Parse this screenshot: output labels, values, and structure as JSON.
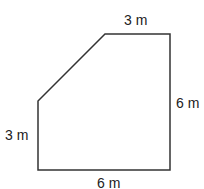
{
  "diagram": {
    "type": "polygon",
    "stroke_color": "#333333",
    "fill_color": "#ffffff",
    "vertices": [
      [
        105,
        34
      ],
      [
        170,
        34
      ],
      [
        170,
        170
      ],
      [
        38,
        170
      ],
      [
        38,
        101
      ]
    ],
    "labels": {
      "top": "3 m",
      "right": "6 m",
      "bottom": "6 m",
      "left": "3 m"
    }
  }
}
